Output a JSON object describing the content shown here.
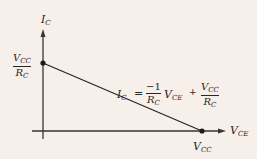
{
  "diagram": {
    "y_axis": {
      "label": "I",
      "label_sub": "C"
    },
    "x_axis": {
      "label": "V",
      "label_sub": "CE"
    },
    "y_intercept": {
      "num": "V",
      "num_sub": "CC",
      "den": "R",
      "den_sub": "C"
    },
    "x_intercept": {
      "label": "V",
      "label_sub": "CC"
    },
    "equation": {
      "lhs": "I",
      "lhs_sub": "C",
      "eq": "=",
      "coef_num": "−1",
      "coef_den": "R",
      "coef_den_sub": "C",
      "var": "V",
      "var_sub": "CE",
      "plus": "+",
      "term_num": "V",
      "term_num_sub": "CC",
      "term_den": "R",
      "term_den_sub": "C"
    },
    "colors": {
      "background": "#f6efea",
      "ink": "#2b2528"
    }
  }
}
